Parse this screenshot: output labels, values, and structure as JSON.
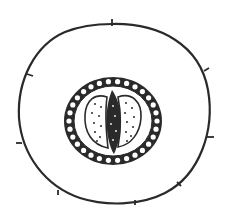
{
  "diagram": {
    "type": "cross-section line drawing",
    "background": "#ffffff",
    "stroke_color": "#2a2a2a",
    "labels": [],
    "parts": [
      {
        "name": "outer-epidermis",
        "shape": "circle",
        "ticks": 8
      },
      {
        "name": "beaded-ring",
        "shape": "ellipse ring of small circles"
      },
      {
        "name": "left-dotted-lobe",
        "shape": "dotted oval"
      },
      {
        "name": "right-dotted-lobe",
        "shape": "dotted oval"
      },
      {
        "name": "central-dark-spindle",
        "shape": "dark elongated spindle"
      }
    ]
  }
}
